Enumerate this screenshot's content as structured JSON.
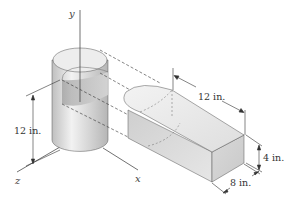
{
  "figure": {
    "type": "engineering-diagram",
    "axes": {
      "y": "y",
      "z": "z",
      "x": "x"
    },
    "dimensions": {
      "cylinder_height": "12 in.",
      "prism_length": "12 in.",
      "prism_height": "4 in.",
      "prism_width": "8 in."
    },
    "colors": {
      "line": "#333333",
      "surface_light": "#f0f0f0",
      "surface_mid": "#d6d6d6",
      "surface_dark": "#bdbdbd"
    }
  }
}
